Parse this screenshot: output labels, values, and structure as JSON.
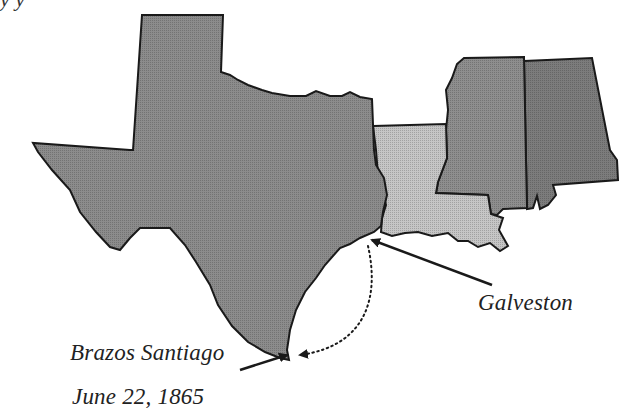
{
  "map": {
    "title_fragment": "y          y",
    "states": [
      {
        "name": "Texas",
        "fill": "#8c8c8c"
      },
      {
        "name": "Louisiana",
        "fill": "#c6c6c6"
      },
      {
        "name": "Mississippi",
        "fill": "#8e8e8e"
      },
      {
        "name": "Alabama",
        "fill": "#7c7c7c"
      }
    ],
    "stroke": "#1a1a1a",
    "labels": {
      "galveston": "Galveston",
      "brazos": "Brazos Santiago",
      "date": "June 22, 1865"
    },
    "route": {
      "from": "Brazos Santiago",
      "to": "Galveston",
      "style": "dotted"
    }
  }
}
